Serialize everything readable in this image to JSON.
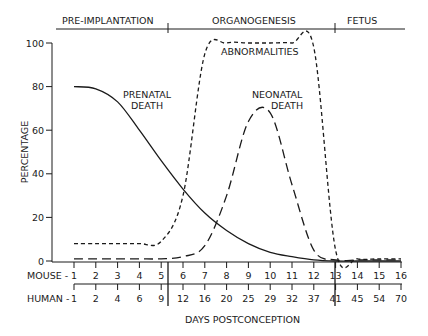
{
  "chart_data": {
    "type": "line",
    "title": "",
    "xlabel": "DAYS POSTCONCEPTION",
    "ylabel": "PERCENTAGE",
    "ylim": [
      0,
      100
    ],
    "yticks": [
      0,
      20,
      40,
      60,
      80,
      100
    ],
    "grid": false,
    "legend": "inline labels",
    "phases": [
      {
        "label": "PRE-IMPLANTATION",
        "from_mouse_day": 0.5,
        "to_mouse_day": 5.5
      },
      {
        "label": "ORGANOGENESIS",
        "from_mouse_day": 5.5,
        "to_mouse_day": 13
      },
      {
        "label": "FETUS",
        "from_mouse_day": 13,
        "to_mouse_day": 16
      }
    ],
    "x_axes": [
      {
        "label": "MOUSE -",
        "ticks": [
          "1",
          "2",
          "3",
          "4",
          "5",
          "6",
          "7",
          "8",
          "9",
          "10",
          "11",
          "12",
          "13",
          "14",
          "15",
          "16"
        ]
      },
      {
        "label": "HUMAN -",
        "ticks": [
          "1",
          "2",
          "4",
          "6",
          "9",
          "12",
          "16",
          "20",
          "25",
          "29",
          "32",
          "37",
          "41",
          "45",
          "54",
          "70"
        ]
      }
    ],
    "x": [
      1,
      2,
      3,
      4,
      5,
      6,
      7,
      8,
      9,
      10,
      11,
      12,
      13,
      14,
      15,
      16
    ],
    "series": [
      {
        "name": "PRENATAL DEATH",
        "style": "solid",
        "values": [
          80,
          79,
          73,
          60,
          46,
          33,
          22,
          14,
          8,
          4,
          2,
          0.5,
          0,
          0,
          0,
          0
        ]
      },
      {
        "name": "ABNORMALITIES",
        "style": "short-dash",
        "values": [
          8,
          8,
          8,
          8,
          9,
          30,
          95,
          100,
          100,
          100,
          100,
          98,
          5,
          1,
          1,
          1
        ]
      },
      {
        "name": "NEONATAL DEATH",
        "style": "long-dash",
        "values": [
          1,
          1,
          1,
          1,
          1,
          2,
          7,
          30,
          64,
          68,
          35,
          5,
          0.5,
          0.5,
          0.5,
          0.5
        ]
      }
    ],
    "annotations": [
      "PRENATAL DEATH",
      "ABNORMALITIES",
      "NEONATAL DEATH"
    ]
  },
  "labels": {
    "phase1": "PRE-IMPLANTATION",
    "phase2": "ORGANOGENESIS",
    "phase3": "FETUS",
    "ylabel": "PERCENTAGE",
    "xlabel": "DAYS POSTCONCEPTION",
    "mouse": "MOUSE -",
    "human": "HUMAN -",
    "prenatal1": "PRENATAL",
    "prenatal2": "DEATH",
    "abnormalities": "ABNORMALITIES",
    "neonatal1": "NEONATAL",
    "neonatal2": "DEATH"
  }
}
